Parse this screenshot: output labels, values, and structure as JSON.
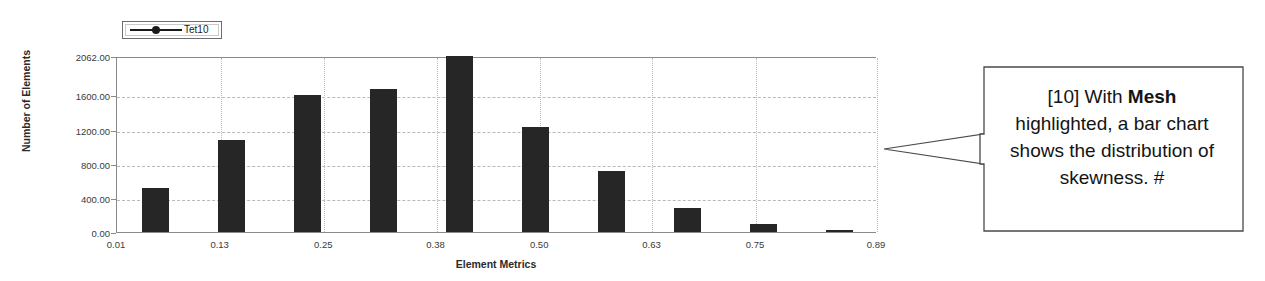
{
  "chart_data": {
    "type": "bar",
    "title": "",
    "xlabel": "Element Metrics",
    "ylabel": "Number of Elements",
    "xlim": [
      0.01,
      0.89
    ],
    "ylim": [
      0,
      2062
    ],
    "grid": true,
    "legend": {
      "position": "top-left",
      "entries": [
        {
          "label": "Tet10",
          "marker": "line-circle",
          "color": "#1a1a1a"
        }
      ]
    },
    "xticks": [
      "0.01",
      "0.13",
      "0.25",
      "0.38",
      "0.50",
      "0.63",
      "0.75",
      "0.89"
    ],
    "xtick_values": [
      0.01,
      0.13,
      0.25,
      0.38,
      0.5,
      0.63,
      0.75,
      0.89
    ],
    "yticks": [
      "0.00",
      "400.00",
      "800.00",
      "1200.00",
      "1600.00",
      "2062.00"
    ],
    "ytick_values": [
      0,
      400,
      800,
      1200,
      1600,
      2062
    ],
    "bar_color": "#262626",
    "categories": [
      0.055,
      0.143,
      0.231,
      0.319,
      0.407,
      0.495,
      0.583,
      0.671,
      0.759,
      0.847
    ],
    "values": [
      520,
      1080,
      1610,
      1670,
      2062,
      1225,
      715,
      280,
      90,
      20
    ],
    "series": [
      {
        "name": "Tet10",
        "values": [
          520,
          1080,
          1610,
          1670,
          2062,
          1225,
          715,
          280,
          90,
          20
        ]
      }
    ]
  },
  "callout": {
    "prefix": "[10] With ",
    "emphasis": "Mesh",
    "suffix": " highlighted, a bar chart shows the distribution of skewness. #",
    "full_text": "[10] With Mesh highlighted, a bar chart shows the distribution of skewness. #",
    "border_color": "#4a4a4a",
    "background": "#ffffff"
  }
}
